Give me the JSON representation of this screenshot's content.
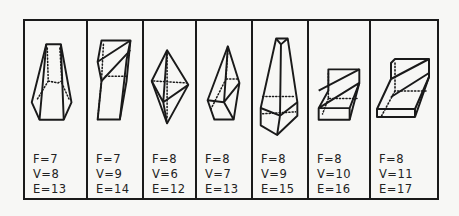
{
  "figure": {
    "panels": [
      {
        "id": 1,
        "shape": "truncated-pyramid-pentagonal-base",
        "F": "F=7",
        "V": "V=8",
        "E": "E=13"
      },
      {
        "id": 2,
        "shape": "sliced-prism",
        "F": "F=7",
        "V": "V=9",
        "E": "E=14"
      },
      {
        "id": 3,
        "shape": "bipyramid",
        "F": "F=8",
        "V": "V=6",
        "E": "E=12"
      },
      {
        "id": 4,
        "shape": "pyramid-on-prism",
        "F": "F=8",
        "V": "V=7",
        "E": "E=13"
      },
      {
        "id": 5,
        "shape": "tall-tapered-solid",
        "F": "F=8",
        "V": "V=9",
        "E": "E=15"
      },
      {
        "id": 6,
        "shape": "sliced-slab",
        "F": "F=8",
        "V": "V=10",
        "E": "E=16"
      },
      {
        "id": 7,
        "shape": "sliced-slab-wide",
        "F": "F=8",
        "V": "V=11",
        "E": "E=17"
      }
    ]
  }
}
